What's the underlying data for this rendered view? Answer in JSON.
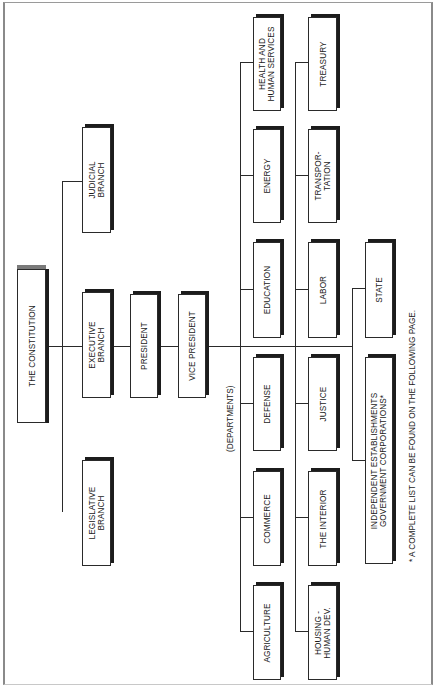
{
  "diagram": {
    "type": "org-chart",
    "orientation": "rotated-90-ccw",
    "root": {
      "label": "THE CONSTITUTION"
    },
    "branches": [
      {
        "id": "judicial",
        "label": "JUDICIAL\nBRANCH"
      },
      {
        "id": "executive",
        "label": "EXECUTIVE\nBRANCH"
      },
      {
        "id": "legislative",
        "label": "LEGISLATIVE\nBRANCH"
      }
    ],
    "executive_chain": [
      {
        "id": "president",
        "label": "PRESIDENT"
      },
      {
        "id": "vice_president",
        "label": "VICE PRESIDENT"
      }
    ],
    "departments_label": "(DEPARTMENTS)",
    "departments": {
      "row1": [
        {
          "id": "hhs",
          "label": "HEALTH AND\nHUMAN SERVICES"
        },
        {
          "id": "energy",
          "label": "ENERGY"
        },
        {
          "id": "education",
          "label": "EDUCATION"
        },
        {
          "id": "defense",
          "label": "DEFENSE"
        },
        {
          "id": "commerce",
          "label": "COMMERCE"
        },
        {
          "id": "agriculture",
          "label": "AGRICULTURE"
        }
      ],
      "row2": [
        {
          "id": "treasury",
          "label": "TREASURY"
        },
        {
          "id": "transportation",
          "label": "TRANSPOR-\nTATION"
        },
        {
          "id": "labor",
          "label": "LABOR"
        },
        {
          "id": "justice",
          "label": "JUSTICE"
        },
        {
          "id": "interior",
          "label": "THE INTERIOR"
        },
        {
          "id": "housing",
          "label": "HOUSING -\nHUMAN DEV."
        }
      ],
      "row3": [
        {
          "id": "state",
          "label": "STATE"
        },
        {
          "id": "independent",
          "label": "INDEPENDENT ESTABLISHMENTS\nGOVERNMENT CORPORATIONS*"
        }
      ]
    },
    "footnote": "* A COMPLETE LIST CAN BE FOUND ON THE FOLLOWING PAGE."
  }
}
